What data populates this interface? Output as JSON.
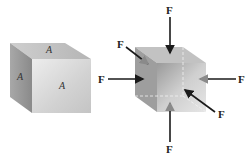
{
  "figure": {
    "left_cube": {
      "face_label_top": "A",
      "face_label_left": "A",
      "face_label_front": "A"
    },
    "right_cube": {
      "force_labels": {
        "top": "F",
        "upper_left": "F",
        "left": "F",
        "right": "F",
        "lower_right": "F",
        "bottom": "F"
      }
    },
    "colors": {
      "cube_light": "#e6e6e6",
      "cube_mid": "#bdbdbd",
      "cube_dark": "#8f8f8f",
      "arrow": "#1a1a1a"
    }
  }
}
